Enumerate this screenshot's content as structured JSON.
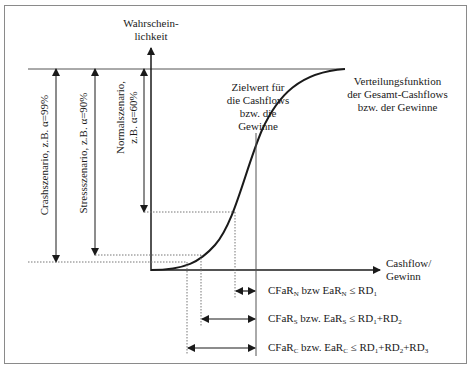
{
  "axes": {
    "y_label_line1": "Wahrschein-",
    "y_label_line2": "lichkeit",
    "x_label_line1": "Cashflow/",
    "x_label_line2": "Gewinn"
  },
  "target_label": {
    "line1": "Zielwert für",
    "line2": "die Cashflows",
    "line3": "bzw. die",
    "line4": "Gewinne"
  },
  "distribution_label": {
    "line1": "Verteilungsfunktion",
    "line2": "der Gesamt-Cashflows",
    "line3": "bzw. der Gewinne"
  },
  "scenarios": [
    {
      "name": "Crashszenario",
      "text": "Crashszenario, z.B. α=99%"
    },
    {
      "name": "Stressszenario",
      "text": "Stressszenario, z.B. α=90%"
    },
    {
      "name": "Normalszenario",
      "line1": "Normalszenario,",
      "line2": "z.B. α=60%"
    }
  ],
  "equations": [
    {
      "a": "CFaR",
      "a_sub": "N",
      "mid": " bzw EaR",
      "b_sub": "N",
      "rhs": " ≤ RD",
      "rhs_sub1": "1",
      "rhs_rest": ""
    },
    {
      "a": "CFaR",
      "a_sub": "S",
      "mid": " bzw. EaR",
      "b_sub": "S",
      "rhs": " ≤ RD",
      "rhs_sub1": "1",
      "rhs_rest": "+RD",
      "rhs_sub2": "2"
    },
    {
      "a": "CFaR",
      "a_sub": "C",
      "mid": " bzw. EaR",
      "b_sub": "C",
      "rhs": " ≤ RD",
      "rhs_sub1": "1",
      "rhs_rest": "+RD",
      "rhs_sub2": "2",
      "rhs_rest2": "+RD",
      "rhs_sub3": "3"
    }
  ],
  "colors": {
    "line": "#1a1a1a",
    "dotted": "#777777",
    "frame": "#8a8a8a"
  }
}
